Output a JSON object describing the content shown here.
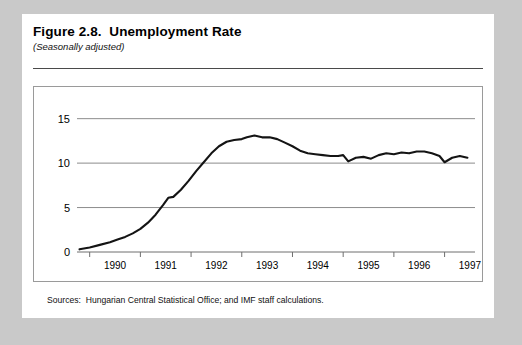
{
  "figure": {
    "title": "Figure 2.8.  Unemployment Rate",
    "subtitle": "(Seasonally adjusted)",
    "source_note": "Sources:  Hungarian Central Statistical Office; and IMF staff calculations."
  },
  "chart_data": {
    "type": "line",
    "title": "Unemployment Rate",
    "subtitle": "(Seasonally adjusted)",
    "xlabel": "",
    "ylabel": "",
    "xlim": [
      1989.75,
      1997.6
    ],
    "ylim": [
      0,
      16.2
    ],
    "yticks": [
      0,
      5,
      10,
      15
    ],
    "ytick_labels": [
      "0",
      "5",
      "10",
      "15"
    ],
    "xticks": [
      1990,
      1991,
      1992,
      1993,
      1994,
      1995,
      1996,
      1997
    ],
    "xtick_labels": [
      "1990",
      "1991",
      "1992",
      "1993",
      "1994",
      "1995",
      "1996",
      "1997"
    ],
    "grid": true,
    "grid_axis": "y",
    "legend": false,
    "series": [
      {
        "name": "Unemployment rate",
        "color": "#141414",
        "x": [
          1989.8,
          1990.0,
          1990.2,
          1990.4,
          1990.55,
          1990.7,
          1990.85,
          1991.0,
          1991.15,
          1991.3,
          1991.45,
          1991.55,
          1991.65,
          1991.8,
          1991.95,
          1992.1,
          1992.25,
          1992.4,
          1992.55,
          1992.7,
          1992.85,
          1993.0,
          1993.1,
          1993.25,
          1993.4,
          1993.55,
          1993.7,
          1993.85,
          1994.0,
          1994.15,
          1994.3,
          1994.45,
          1994.6,
          1994.75,
          1994.9,
          1995.0,
          1995.1,
          1995.25,
          1995.4,
          1995.55,
          1995.7,
          1995.85,
          1996.0,
          1996.15,
          1996.3,
          1996.45,
          1996.6,
          1996.75,
          1996.9,
          1997.0,
          1997.15,
          1997.3,
          1997.45
        ],
        "y": [
          0.3,
          0.5,
          0.8,
          1.1,
          1.4,
          1.7,
          2.1,
          2.6,
          3.3,
          4.2,
          5.3,
          6.1,
          6.2,
          7.0,
          8.0,
          9.1,
          10.1,
          11.1,
          11.9,
          12.4,
          12.6,
          12.7,
          12.9,
          13.1,
          12.9,
          12.9,
          12.7,
          12.3,
          11.9,
          11.4,
          11.1,
          11.0,
          10.9,
          10.8,
          10.8,
          10.9,
          10.2,
          10.6,
          10.7,
          10.5,
          10.9,
          11.1,
          11.0,
          11.2,
          11.1,
          11.3,
          11.3,
          11.1,
          10.8,
          10.1,
          10.6,
          10.8,
          10.6
        ]
      }
    ]
  }
}
